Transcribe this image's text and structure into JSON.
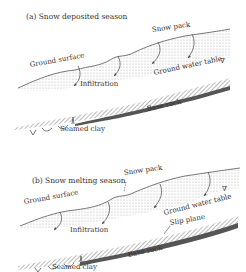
{
  "panels": [
    {
      "id": "a",
      "title": "(a) Snow deposited season",
      "labels": {
        "snow_pack": "Snow pack",
        "ground_surface": "Ground surface",
        "ground_water_table": "Ground water table",
        "water_table_symbol": "∇",
        "infiltration": "Infiltration",
        "base_rock": "Base rock",
        "seamed_clay": "Seamed clay"
      }
    },
    {
      "id": "b",
      "title": "(b) Snow melting season",
      "labels": {
        "snow_pack": "Snow pack",
        "ground_surface": "Ground surface",
        "ground_water_table": "Ground water table",
        "water_table_symbol": "∇",
        "infiltration": "Infiltration",
        "slip_plane": "Slip plane",
        "base_rock": "Base rock",
        "seamed_clay": "Seamed clay"
      }
    }
  ],
  "colors": {
    "line": "#555555",
    "stipple": "#bdbdbd",
    "rock_dark": "#555555",
    "rock_hatch": "#8a8a8a"
  }
}
